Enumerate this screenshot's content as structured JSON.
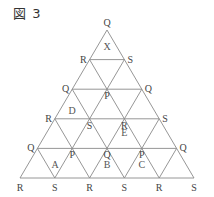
{
  "figure": {
    "title": "図 3",
    "rows": 5,
    "geometry": {
      "apex": [
        107,
        30
      ],
      "base_y": 178,
      "base_left": 20,
      "base_right": 194
    },
    "vertex_rows": [
      [
        "Q"
      ],
      [
        "R",
        "S"
      ],
      [
        "Q",
        "P",
        "Q"
      ],
      [
        "R",
        "S",
        "R",
        "S"
      ],
      [
        "Q",
        "P",
        "Q",
        "P",
        "Q"
      ],
      [
        "R",
        "S",
        "R",
        "S",
        "R",
        "S"
      ]
    ],
    "regions": [
      {
        "name": "X",
        "x": 107,
        "y": 50
      },
      {
        "name": "D",
        "x": 72,
        "y": 114
      },
      {
        "name": "E",
        "x": 124.4,
        "y": 136
      },
      {
        "name": "A",
        "x": 55,
        "y": 168
      },
      {
        "name": "B",
        "x": 107,
        "y": 168
      },
      {
        "name": "C",
        "x": 141.8,
        "y": 168
      }
    ]
  }
}
